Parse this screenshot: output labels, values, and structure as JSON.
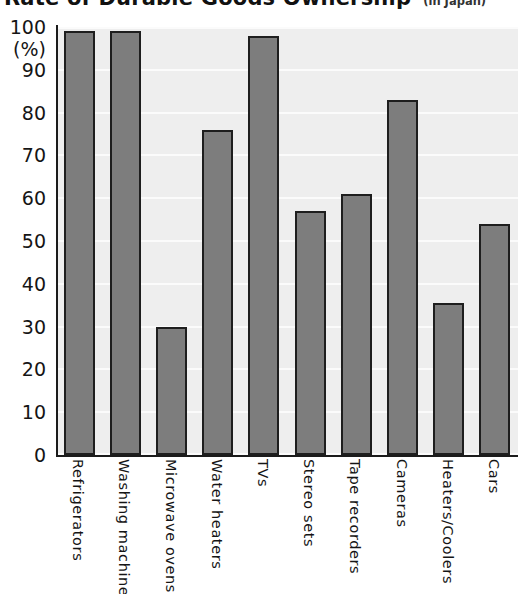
{
  "header": {
    "title": "Rate of Durable Goods Ownership",
    "subtitle": "(in Japan)"
  },
  "axis": {
    "y_unit_label": "(%)",
    "y_ticks": [
      "100",
      "90",
      "80",
      "70",
      "60",
      "50",
      "40",
      "30",
      "20",
      "10",
      "0"
    ]
  },
  "chart_data": {
    "type": "bar",
    "title": "Rate of Durable Goods Ownership",
    "subtitle": "(in Japan)",
    "xlabel": "",
    "ylabel": "(%)",
    "ylim": [
      0,
      100
    ],
    "ytick_step": 10,
    "grid": true,
    "legend": "none",
    "bar_fill_color": "#7d7d7d",
    "bar_border_color": "#1e1e1e",
    "plot_background_color": "#eeeeee",
    "gridline_color": "#fbfbfb",
    "categories": [
      "Refrigerators",
      "Washing machines",
      "Microwave ovens",
      "Water heaters",
      "TVs",
      "Stereo sets",
      "Tape recorders",
      "Cameras",
      "Heaters/Coolers",
      "Cars"
    ],
    "values": [
      99,
      99,
      30,
      76,
      98,
      57,
      61,
      83,
      35.5,
      54
    ]
  }
}
